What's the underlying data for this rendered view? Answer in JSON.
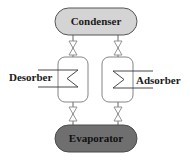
{
  "diagram": {
    "type": "adsorption-refrigeration-cycle",
    "condenser": {
      "label": "Condenser",
      "fill": "#d4d4d4",
      "stroke": "#555555",
      "text_color": "#1a1a1a"
    },
    "evaporator": {
      "label": "Evaporator",
      "fill": "#6f6f6f",
      "stroke": "#4a4a4a",
      "text_color": "#111111"
    },
    "desorber": {
      "label": "Desorber"
    },
    "adsorber": {
      "label": "Adsorber"
    },
    "valves": [
      {
        "id": "valve-condenser-desorber"
      },
      {
        "id": "valve-condenser-adsorber"
      },
      {
        "id": "valve-desorber-evaporator"
      },
      {
        "id": "valve-adsorber-evaporator"
      }
    ],
    "colors": {
      "line": "#555555",
      "valve": "#888888",
      "vessel_stroke": "#777777"
    }
  }
}
